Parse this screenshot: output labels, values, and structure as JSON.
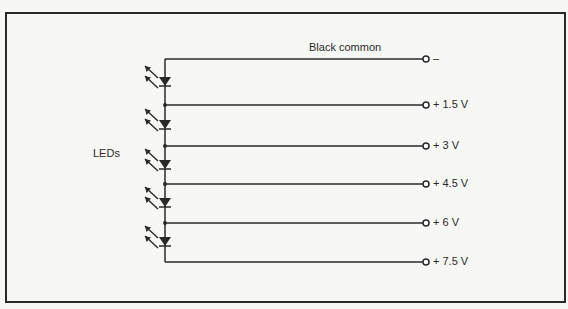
{
  "figure": {
    "frame": {
      "x": 6,
      "y": 13,
      "width": 559,
      "height": 289
    },
    "spine_x": 165,
    "terminal_x": 426,
    "top_wire_y": 59,
    "bottom_wire_y": 262,
    "labels": {
      "common": "Black common",
      "leds": "LEDs"
    },
    "terminals": [
      {
        "label": "–",
        "y": 59
      },
      {
        "label": "+ 1.5 V",
        "y": 105
      },
      {
        "label": "+ 3 V",
        "y": 146
      },
      {
        "label": "+ 4.5 V",
        "y": 184
      },
      {
        "label": "+  6 V",
        "y": 223
      },
      {
        "label": "+ 7.5 V",
        "y": 262
      }
    ],
    "leds": [
      {
        "y": 82
      },
      {
        "y": 125
      },
      {
        "y": 165
      },
      {
        "y": 203
      },
      {
        "y": 242
      }
    ],
    "caption_fragment": "...the end of the black..."
  },
  "colors": {
    "ink": "#2a2a2a",
    "paper": "#f7f7f5"
  }
}
